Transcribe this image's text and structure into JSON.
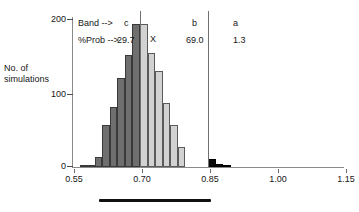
{
  "chart_data": {
    "type": "bar",
    "title": "",
    "xlabel": "",
    "ylabel": "No. of\nsimulations",
    "xlim": [
      0.55,
      1.15
    ],
    "ylim": [
      0,
      215
    ],
    "grid": false,
    "legend": "none",
    "xtick_labels": [
      "0.55",
      "0.70",
      "0.85",
      "1.00",
      "1.15"
    ],
    "xtick_values": [
      0.55,
      0.7,
      0.85,
      1.0,
      1.15
    ],
    "ytick_labels": [
      "0",
      "100",
      "200"
    ],
    "ytick_values": [
      0,
      100,
      200
    ],
    "bin_width": 0.0167,
    "bin_starts": [
      0.5667,
      0.5833,
      0.6,
      0.6167,
      0.6333,
      0.65,
      0.6667,
      0.6833,
      0.7,
      0.7167,
      0.7333,
      0.75,
      0.7667,
      0.7833,
      0.8,
      0.8167,
      0.8333,
      0.85,
      0.8667,
      0.8833,
      0.9
    ],
    "values": [
      2,
      3,
      14,
      60,
      86,
      127,
      160,
      205,
      205,
      163,
      137,
      92,
      60,
      29,
      0,
      0,
      0,
      11,
      4,
      2,
      0
    ],
    "band_of_bin": [
      "c",
      "c",
      "c",
      "c",
      "c",
      "c",
      "c",
      "c",
      "b",
      "b",
      "b",
      "b",
      "b",
      "b",
      "b",
      "b",
      "b",
      "a",
      "a",
      "a",
      "a"
    ],
    "bands": [
      {
        "id": "c",
        "label": "c",
        "prob": "29.7",
        "color": "#6f6f6f",
        "range": [
          0.55,
          0.7
        ]
      },
      {
        "id": "b",
        "label": "b",
        "prob": "69.0",
        "color": "#d2d2d2",
        "range": [
          0.7,
          0.85
        ]
      },
      {
        "id": "a",
        "label": "a",
        "prob": "1.3",
        "color": "#0a0a0a",
        "range": [
          0.85,
          1.15
        ]
      }
    ],
    "divider_values": [
      0.7,
      0.85
    ],
    "annotations": [
      {
        "name": "band-row-label",
        "text": "Band -->",
        "x": 0.573,
        "y": 205
      },
      {
        "name": "prob-row-label",
        "text": "%Prob -->",
        "x": 0.573,
        "y": 183
      },
      {
        "name": "x-marker",
        "text": "X",
        "x": 0.717,
        "y": 172
      }
    ]
  },
  "axis": {
    "y_label_line1": "No. of",
    "y_label_line2": "simulations",
    "y_ticks": [
      "200",
      "100",
      "0"
    ],
    "x_ticks": [
      "0.55",
      "0.70",
      "0.85",
      "1.00",
      "1.15"
    ]
  },
  "labels": {
    "band_row": "Band -->",
    "prob_row": "%Prob -->",
    "band_c": "c",
    "band_b": "b",
    "band_a": "a",
    "prob_c": "29.7",
    "prob_b": "69.0",
    "prob_a": "1.3",
    "x_marker": "X"
  },
  "colors": {
    "band_c": "#6f6f6f",
    "band_b": "#d2d2d2",
    "band_a": "#0a0a0a",
    "axis": "#8a8a8a",
    "text": "#161616"
  }
}
